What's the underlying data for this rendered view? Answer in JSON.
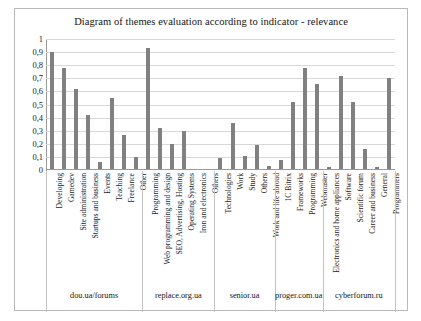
{
  "chart_data": {
    "type": "bar",
    "title": "Diagram of themes evaluation according to indicator - relevance",
    "xlabel": "",
    "ylabel": "",
    "ylim": [
      0,
      1
    ],
    "grid": true,
    "legend": "none",
    "ytick_labels": [
      "1",
      "0,9",
      "0,8",
      "0,7",
      "0,6",
      "0,5",
      "0,4",
      "0,3",
      "0,2",
      "0,1",
      "0"
    ],
    "ytick_values": [
      1,
      0.9,
      0.8,
      0.7,
      0.6,
      0.5,
      0.4,
      0.3,
      0.2,
      0.1,
      0
    ],
    "categories": [
      "Developing",
      "Gamedev",
      "Site administration",
      "Startups and business",
      "Events",
      "Teaching",
      "Freelance",
      "Other",
      "Programming",
      "Web programming and design",
      "SEO, Advertising, Hosting",
      "Operating Systems",
      "Iron and electronics",
      "Others",
      "Technologies",
      "Work",
      "Study",
      "Others",
      "Work and life abroad",
      "1C Bitrix",
      "Frameworks",
      "Programming",
      "Webmaster",
      "Electronics and home appliances",
      "Software",
      "Scientific forum",
      "Career and business",
      "General",
      "Programmers"
    ],
    "values": [
      0.9,
      0.78,
      0.62,
      0.42,
      0.06,
      0.55,
      0.27,
      0.1,
      0.93,
      0.32,
      0.2,
      0.3,
      0.01,
      0.0,
      0.09,
      0.36,
      0.11,
      0.19,
      0.03,
      0.08,
      0.52,
      0.78,
      0.66,
      0.02,
      0.72,
      0.52,
      0.16,
      0.02,
      0.7
    ],
    "groups": [
      {
        "name": "dou.ua/forums",
        "start": 0,
        "count": 8
      },
      {
        "name": "replace.org.ua",
        "start": 8,
        "count": 6
      },
      {
        "name": "senior.ua",
        "start": 14,
        "count": 5
      },
      {
        "name": "proger.com.ua",
        "start": 19,
        "count": 4
      },
      {
        "name": "cyberforum.ru",
        "start": 23,
        "count": 6
      }
    ],
    "bar_color": "#808080"
  }
}
